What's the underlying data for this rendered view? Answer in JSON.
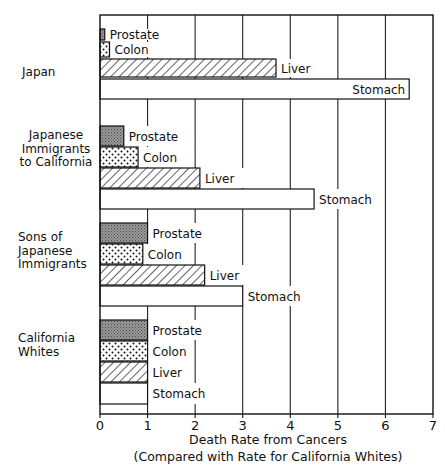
{
  "chart_data": {
    "type": "bar",
    "orientation": "horizontal",
    "title": "",
    "xlabel": "Death Rate from Cancers",
    "xlabel_sub": "(Compared with Rate for California Whites)",
    "ylabel": "",
    "xlim": [
      0,
      7
    ],
    "xticks": [
      "0",
      "1",
      "2",
      "3",
      "4",
      "5",
      "6",
      "7"
    ],
    "grid": "vertical",
    "legend": "none (bars labeled inline)",
    "categories": [
      "Prostate",
      "Colon",
      "Liver",
      "Stomach"
    ],
    "groups": [
      {
        "name": "Japan",
        "label_lines": [
          "Japan"
        ],
        "values": {
          "Prostate": 0.1,
          "Colon": 0.2,
          "Liver": 3.7,
          "Stomach": 6.5
        }
      },
      {
        "name": "Japanese Immigrants to California",
        "label_lines": [
          "Japanese",
          "Immigrants",
          "to California"
        ],
        "values": {
          "Prostate": 0.5,
          "Colon": 0.8,
          "Liver": 2.1,
          "Stomach": 4.5
        }
      },
      {
        "name": "Sons of Japanese Immigrants",
        "label_lines": [
          "Sons of",
          "Japanese",
          "Immigrants"
        ],
        "values": {
          "Prostate": 1.0,
          "Colon": 0.9,
          "Liver": 2.2,
          "Stomach": 3.0
        }
      },
      {
        "name": "California Whites",
        "label_lines": [
          "California",
          "Whites"
        ],
        "values": {
          "Prostate": 1.0,
          "Colon": 1.0,
          "Liver": 1.0,
          "Stomach": 1.0
        }
      }
    ],
    "patterns": {
      "Prostate": "gray-stipple",
      "Colon": "dots",
      "Liver": "diagonal-hatch",
      "Stomach": "white"
    },
    "colors": {
      "ink": "#111111",
      "prostate_fill": "#8a8a8a",
      "background": "#ffffff"
    }
  }
}
